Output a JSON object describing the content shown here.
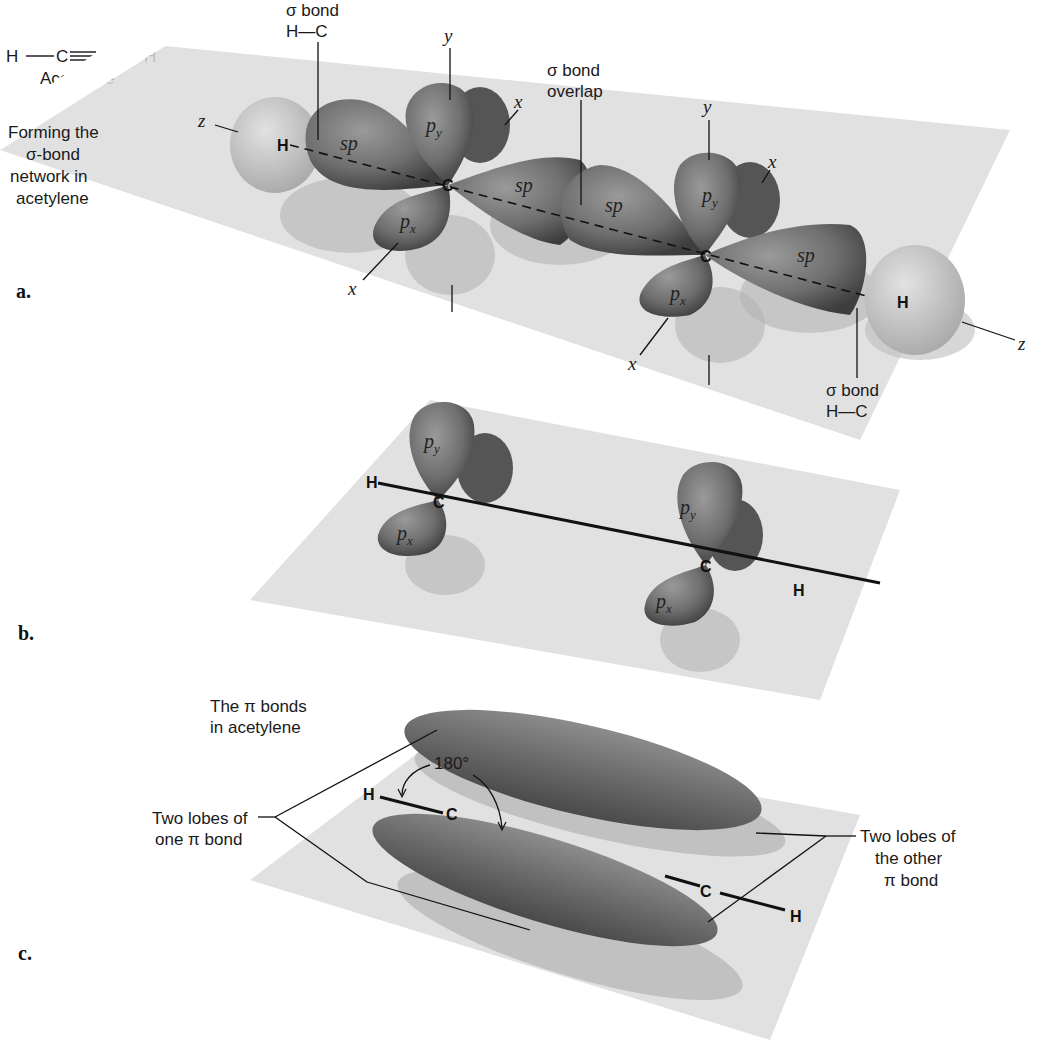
{
  "formula": {
    "left_h": "H",
    "left_c": "C",
    "right_c": "C",
    "right_h": "H",
    "name": "Acetylene"
  },
  "panel_a": {
    "label": "a.",
    "caption_lines": [
      "Forming the",
      "σ-bond",
      "network in",
      "acetylene"
    ],
    "sigma_hc_left": {
      "line1": "σ bond",
      "line2": "H—C"
    },
    "sigma_overlap": {
      "line1": "σ bond",
      "line2": "overlap"
    },
    "sigma_hc_right": {
      "line1": "σ bond",
      "line2": "H—C"
    },
    "axes": {
      "z": "z",
      "y": "y",
      "x": "x"
    },
    "atoms": {
      "h": "H",
      "c": "C"
    },
    "orbitals": {
      "sp": "sp",
      "p": "p",
      "sub_x": "x",
      "sub_y": "y"
    }
  },
  "panel_b": {
    "label": "b.",
    "atoms": {
      "h": "H",
      "c": "C"
    },
    "orbitals": {
      "p": "p",
      "sub_x": "x",
      "sub_y": "y"
    }
  },
  "panel_c": {
    "label": "c.",
    "title_lines": [
      "The π bonds",
      "in acetylene"
    ],
    "angle": "180°",
    "left_callout": [
      "Two lobes of",
      "one π bond"
    ],
    "right_callout": [
      "Two lobes of",
      "the other",
      "π bond"
    ],
    "atoms": {
      "h": "H",
      "c": "C"
    }
  },
  "colors": {
    "plane": "#dcdcdc",
    "lobe_dark": "#5a5a5a",
    "lobe_mid": "#8a8a8a",
    "hydrogen": "#c8c8c8",
    "shadow": "#b4b4b4",
    "ink": "#111111"
  }
}
